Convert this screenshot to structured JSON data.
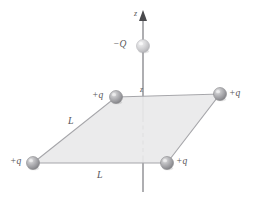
{
  "figure": {
    "name": "square-charge-array-with-point-charge-on-axis",
    "background_color": "#ffffff",
    "line_color": "#8c8c90",
    "plane_fill": "#e9e9ea",
    "text_color": "#58585a"
  },
  "axis": {
    "label_top": "z",
    "label_plane": "z",
    "x": 143,
    "top_y": 12,
    "bottom_y": 192,
    "dash_start_y": 118,
    "dash_end_y": 156,
    "arrow_name": "z-axis-arrowhead"
  },
  "plane": {
    "name": "square-plane-L-by-L",
    "vertices": [
      {
        "x": 116,
        "y": 97
      },
      {
        "x": 220,
        "y": 94
      },
      {
        "x": 167,
        "y": 163
      },
      {
        "x": 33,
        "y": 163
      }
    ]
  },
  "side_labels": [
    {
      "id": "L-left",
      "text": "L",
      "x": 68,
      "y": 116
    },
    {
      "id": "L-bottom",
      "text": "L",
      "x": 97,
      "y": 170
    }
  ],
  "charges": [
    {
      "id": "charge-minus-Q-on-axis",
      "label": "−Q",
      "sign": "negative",
      "cx": 143,
      "cy": 46,
      "r": 6.5,
      "fill": "#d2d2d3",
      "label_x": 113,
      "label_y": 40,
      "label_align": "right"
    },
    {
      "id": "charge-plus-q-back-left",
      "label": "+q",
      "sign": "positive",
      "cx": 116,
      "cy": 97,
      "r": 6.5,
      "fill": "#a9a9ac",
      "label_x": 92,
      "label_y": 91,
      "label_align": "right"
    },
    {
      "id": "charge-plus-q-back-right",
      "label": "+q",
      "sign": "positive",
      "cx": 220,
      "cy": 94,
      "r": 6.5,
      "fill": "#a9a9ac",
      "label_x": 229,
      "label_y": 89,
      "label_align": "left"
    },
    {
      "id": "charge-plus-q-front-left",
      "label": "+q",
      "sign": "positive",
      "cx": 33,
      "cy": 163,
      "r": 6.5,
      "fill": "#a9a9ac",
      "label_x": 10,
      "label_y": 157,
      "label_align": "right"
    },
    {
      "id": "charge-plus-q-front-right",
      "label": "+q",
      "sign": "positive",
      "cx": 167,
      "cy": 163,
      "r": 6.5,
      "fill": "#a9a9ac",
      "label_x": 176,
      "label_y": 157,
      "label_align": "left"
    }
  ],
  "axis_label_positions": {
    "top_label_x": 134,
    "top_label_y": 10,
    "plane_label_x": 140,
    "plane_label_y": 86
  }
}
